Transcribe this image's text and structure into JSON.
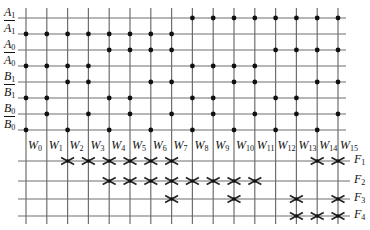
{
  "diagram": {
    "type": "pla-decoder-array",
    "input_lines": [
      {
        "name": "A",
        "sub": "1",
        "complement": false,
        "y": 18,
        "dots": [
          8,
          9,
          10,
          11,
          12,
          13,
          14,
          15
        ]
      },
      {
        "name": "A",
        "sub": "1",
        "complement": true,
        "y": 34,
        "dots": [
          0,
          1,
          2,
          3,
          4,
          5,
          6,
          7
        ]
      },
      {
        "name": "A",
        "sub": "0",
        "complement": false,
        "y": 50,
        "dots": [
          4,
          5,
          6,
          7,
          12,
          13,
          14,
          15
        ]
      },
      {
        "name": "A",
        "sub": "0",
        "complement": true,
        "y": 66,
        "dots": [
          0,
          1,
          2,
          3,
          8,
          9,
          10,
          11
        ]
      },
      {
        "name": "B",
        "sub": "1",
        "complement": false,
        "y": 82,
        "dots": [
          2,
          3,
          6,
          7,
          10,
          11,
          14,
          15
        ]
      },
      {
        "name": "B",
        "sub": "1",
        "complement": true,
        "y": 98,
        "dots": [
          0,
          1,
          4,
          5,
          8,
          9,
          12,
          13
        ]
      },
      {
        "name": "B",
        "sub": "0",
        "complement": false,
        "y": 114,
        "dots": [
          1,
          3,
          5,
          7,
          9,
          11,
          13,
          15
        ]
      },
      {
        "name": "B",
        "sub": "0",
        "complement": true,
        "y": 130,
        "dots": [
          0,
          2,
          4,
          6,
          8,
          10,
          12,
          14
        ]
      }
    ],
    "word_lines": [
      {
        "name": "W",
        "sub": "0"
      },
      {
        "name": "W",
        "sub": "1"
      },
      {
        "name": "W",
        "sub": "2"
      },
      {
        "name": "W",
        "sub": "3"
      },
      {
        "name": "W",
        "sub": "4"
      },
      {
        "name": "W",
        "sub": "5"
      },
      {
        "name": "W",
        "sub": "6"
      },
      {
        "name": "W",
        "sub": "7"
      },
      {
        "name": "W",
        "sub": "8"
      },
      {
        "name": "W",
        "sub": "9"
      },
      {
        "name": "W",
        "sub": "10"
      },
      {
        "name": "W",
        "sub": "11"
      },
      {
        "name": "W",
        "sub": "12"
      },
      {
        "name": "W",
        "sub": "13"
      },
      {
        "name": "W",
        "sub": "14"
      },
      {
        "name": "W",
        "sub": "15"
      }
    ],
    "output_lines": [
      {
        "name": "F",
        "sub": "1",
        "y": 161,
        "crosses": [
          2,
          3,
          4,
          5,
          6,
          7,
          14,
          15
        ]
      },
      {
        "name": "F",
        "sub": "2",
        "y": 181,
        "crosses": [
          4,
          5,
          6,
          7,
          8,
          9,
          10,
          11
        ]
      },
      {
        "name": "F",
        "sub": "3",
        "y": 199,
        "crosses": [
          7,
          10,
          13,
          15
        ]
      },
      {
        "name": "F",
        "sub": "4",
        "y": 216,
        "crosses": [
          13,
          14,
          15
        ]
      }
    ],
    "colors": {
      "line": "#6e6e6e",
      "dot": "#111111",
      "cross": "#222222",
      "text": "#111111"
    }
  }
}
